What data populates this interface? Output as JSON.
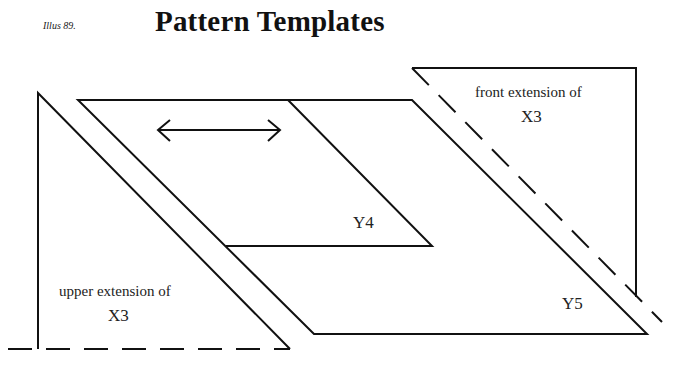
{
  "header": {
    "caption": "Illus 89.",
    "title": "Pattern Templates"
  },
  "diagram": {
    "stroke_color": "#111111",
    "labels": {
      "upper_extension": "upper extension of",
      "upper_extension_ref": "X3",
      "front_extension": "front extension of",
      "front_extension_ref": "X3",
      "y4": "Y4",
      "y5": "Y5"
    },
    "icons": {
      "arrow": "double-headed-arrow"
    }
  }
}
